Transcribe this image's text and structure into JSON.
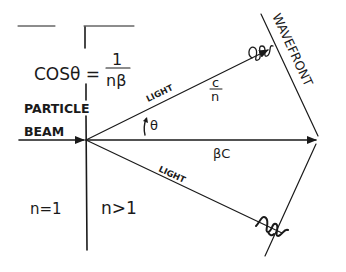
{
  "diagram": {
    "formula": {
      "lhs": "COSθ =",
      "numerator": "1",
      "denominator": "nβ"
    },
    "labels": {
      "particle": "PARTICLE",
      "beam": "BEAM",
      "light_upper": "LIGHT",
      "light_lower": "LIGHT",
      "theta": "θ",
      "speed_light_num": "c",
      "speed_light_den": "n",
      "particle_speed": "βC",
      "wavefront": "WAVEFRONT",
      "medium_left": "n=1",
      "medium_right": "n>1"
    },
    "colors": {
      "ink": "#1a1a1a",
      "background": "#ffffff"
    }
  }
}
